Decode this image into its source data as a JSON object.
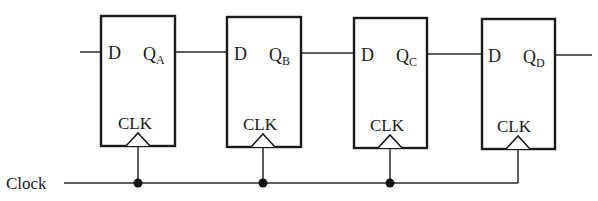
{
  "diagram": {
    "type": "shift-register",
    "clock_label": "Clock",
    "flip_flops": [
      {
        "id": "A",
        "d_label": "D",
        "q_label": "Q",
        "q_sub": "A",
        "clk_label": "CLK",
        "x": 101,
        "y": 16,
        "w": 74,
        "h": 130
      },
      {
        "id": "B",
        "d_label": "D",
        "q_label": "Q",
        "q_sub": "B",
        "clk_label": "CLK",
        "x": 227,
        "y": 17,
        "w": 74,
        "h": 130
      },
      {
        "id": "C",
        "d_label": "D",
        "q_label": "Q",
        "q_sub": "C",
        "clk_label": "CLK",
        "x": 354,
        "y": 18,
        "w": 73,
        "h": 130
      },
      {
        "id": "D",
        "d_label": "D",
        "q_label": "Q",
        "q_sub": "D",
        "clk_label": "CLK",
        "x": 482,
        "y": 19,
        "w": 73,
        "h": 130
      }
    ],
    "colors": {
      "line": "#1a1a1a",
      "background": "#ffffff"
    }
  }
}
